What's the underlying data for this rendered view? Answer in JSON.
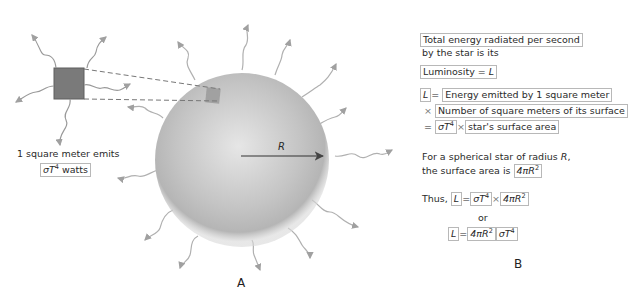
{
  "panel_a": {
    "label": "A",
    "caption_line1": "1 square meter emits",
    "caption_box_prefix": "σT",
    "caption_box_exp": "4",
    "caption_box_suffix": " watts",
    "radius_label": "R"
  },
  "panel_b": {
    "label": "B",
    "intro_line1": "Total energy radiated per second",
    "intro_line2": "by the star is its",
    "luminosity": "Luminosity = ",
    "L": "L",
    "eq": "=",
    "times": "×",
    "line_energy": "Energy emitted by 1 square meter",
    "line_number": "Number of square meters of its surface",
    "sigma_t": "σT",
    "exp4": "4",
    "surface_area": "star's surface area",
    "sphere_line1_prefix": "For a spherical star of radius ",
    "sphere_line1_var": "R",
    "sphere_line1_suffix": ",",
    "sphere_line2": "the surface area is",
    "four_pi_r": "4πR",
    "exp2": "2",
    "thus": "Thus,",
    "or": "or"
  },
  "colors": {
    "star_fill": "#b9b9b9",
    "square_fill": "#7a7a7a",
    "wave": "#a8a8a8",
    "box_border": "#b8b8b8"
  }
}
